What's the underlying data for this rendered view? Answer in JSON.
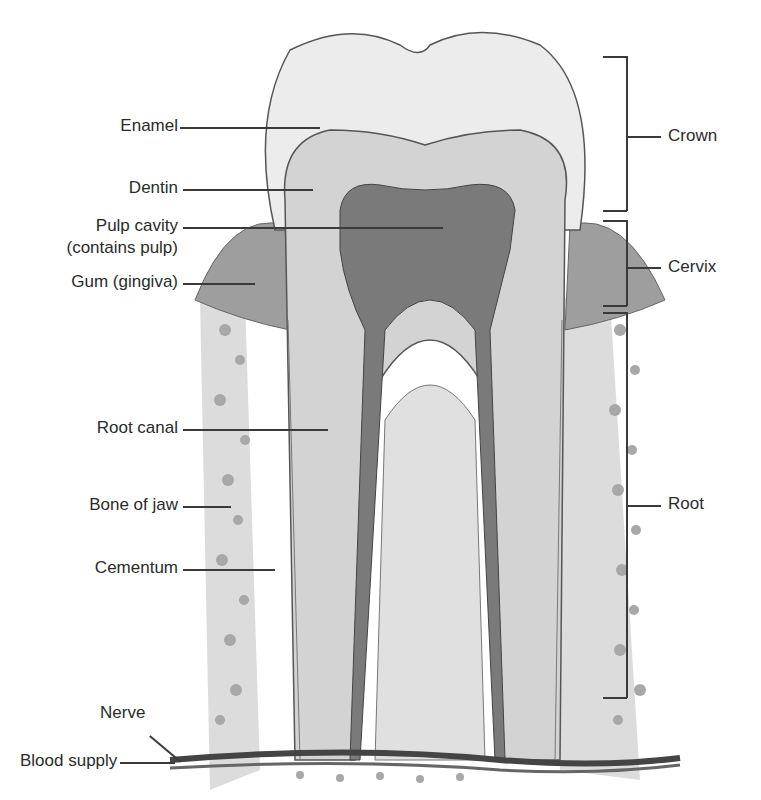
{
  "diagram": {
    "left_labels": [
      {
        "id": "enamel",
        "text": "Enamel"
      },
      {
        "id": "dentin",
        "text": "Dentin"
      },
      {
        "id": "pulp_cavity_1",
        "text": "Pulp cavity"
      },
      {
        "id": "pulp_cavity_2",
        "text": "(contains pulp)"
      },
      {
        "id": "gum",
        "text": "Gum (gingiva)"
      },
      {
        "id": "root_canal",
        "text": "Root canal"
      },
      {
        "id": "bone",
        "text": "Bone of jaw"
      },
      {
        "id": "cementum",
        "text": "Cementum"
      },
      {
        "id": "nerve",
        "text": "Nerve"
      },
      {
        "id": "blood",
        "text": "Blood supply"
      }
    ],
    "right_labels": [
      {
        "id": "crown",
        "text": "Crown"
      },
      {
        "id": "cervix",
        "text": "Cervix"
      },
      {
        "id": "root",
        "text": "Root"
      }
    ],
    "colors": {
      "enamel": "#e8e8e8",
      "dentin": "#cfcfcf",
      "pulp": "#6e6e6e",
      "gum": "#9a9a9a",
      "bone": "#b8b8b8",
      "nerve": "#4a4a4a",
      "outline": "#555555"
    }
  }
}
